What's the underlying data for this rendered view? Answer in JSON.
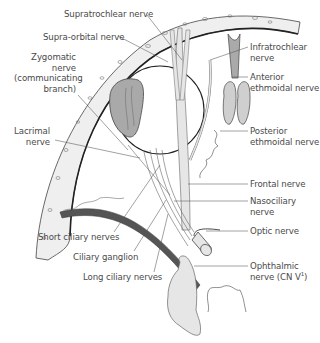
{
  "diagram": {
    "colors": {
      "nerve_fill": "#e6e6e6",
      "gland_fill": "#a9a9a9",
      "line": "#444444",
      "text": "#4a4a4a",
      "bone_fill": "#eeeeee"
    },
    "labels": {
      "supratrochlear": "Supratrochlear nerve",
      "supraorbital": "Supra-orbital nerve",
      "zygomatic_1": "Zygomatic",
      "zygomatic_2": "nerve",
      "zygomatic_3": "(communicating",
      "zygomatic_4": "branch)",
      "lacrimal_1": "Lacrimal",
      "lacrimal_2": "nerve",
      "infratrochlear_1": "Infratrochlear",
      "infratrochlear_2": "nerve",
      "anterior_ethmoidal_1": "Anterior",
      "anterior_ethmoidal_2": "ethmoidal nerve",
      "posterior_ethmoidal_1": "Posterior",
      "posterior_ethmoidal_2": "ethmoidal nerve",
      "frontal": "Frontal nerve",
      "nasociliary_1": "Nasociliary",
      "nasociliary_2": "nerve",
      "optic": "Optic nerve",
      "ophthalmic_1": "Ophthalmic",
      "ophthalmic_2": "nerve (CN V",
      "ophthalmic_sup": "1",
      "ophthalmic_3": ")",
      "short_ciliary": "Short ciliary nerves",
      "ciliary_ganglion": "Ciliary ganglion",
      "long_ciliary": "Long ciliary nerves"
    }
  }
}
